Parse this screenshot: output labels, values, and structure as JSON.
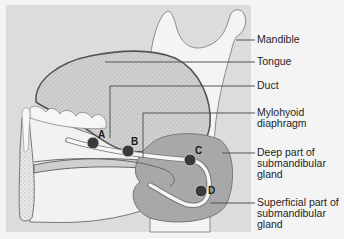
{
  "diagram": {
    "colors": {
      "panel": "#dcdcdc",
      "page": "#f4f4f4",
      "outline": "#6a6a6a",
      "gland": "#a8a8a8",
      "point": "#3a3a3a",
      "leader": "#555555"
    },
    "labels": [
      {
        "id": "mandible",
        "text": "Mandible"
      },
      {
        "id": "tongue",
        "text": "Tongue"
      },
      {
        "id": "duct",
        "text": "Duct"
      },
      {
        "id": "mylohyoid",
        "text": "Mylohyoid\ndiaphragm"
      },
      {
        "id": "deep",
        "text": "Deep part of\nsubmandibular\ngland"
      },
      {
        "id": "superficial",
        "text": "Superficial part of\nsubmandibular\ngland"
      }
    ],
    "points": [
      {
        "id": "A",
        "text": "A"
      },
      {
        "id": "B",
        "text": "B"
      },
      {
        "id": "C",
        "text": "C"
      },
      {
        "id": "D",
        "text": "D"
      }
    ]
  }
}
